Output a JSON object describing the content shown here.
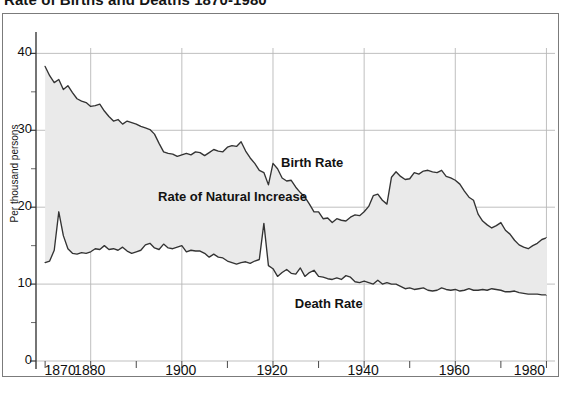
{
  "title": "Rate of Births and Deaths 1870-1980",
  "caption": "",
  "axis": {
    "y_label": "Per thousand persons",
    "y_ticks": [
      0,
      10,
      20,
      30,
      40
    ],
    "y_minor_ticks": [
      5,
      15,
      25,
      35
    ],
    "x_ticks_labeled": [
      1870,
      1880,
      1900,
      1920,
      1940,
      1960,
      1980
    ],
    "x_ticks_unlabeled": [
      1890,
      1910,
      1930,
      1950,
      1970
    ]
  },
  "annotations": [
    {
      "name": "birth-rate",
      "text": "Birth Rate",
      "x": 1922,
      "y": 25.6
    },
    {
      "name": "death-rate",
      "text": "Death Rate",
      "x": 1925,
      "y": 7.3
    },
    {
      "name": "rate-of-natural-increase",
      "text": "Rate of Natural Increase",
      "x": 1895,
      "y": 21.2
    }
  ],
  "colors": {
    "line": "#333333",
    "fill": "#eaeaea",
    "grid": "#b8b8b8",
    "frame": "#7b7b7b",
    "text": "#101010",
    "background": "#ffffff"
  },
  "chart_data": {
    "type": "area",
    "title": "Rate of Births and Deaths 1870-1980",
    "xlabel": "",
    "ylabel": "Per thousand persons",
    "xlim": [
      1868,
      1981
    ],
    "ylim": [
      0,
      42
    ],
    "grid": true,
    "legend": "inline-annotations",
    "fill_between": {
      "upper": "Birth Rate",
      "lower": "Death Rate",
      "label": "Rate of Natural Increase",
      "color": "#eaeaea"
    },
    "x": [
      1870,
      1871,
      1872,
      1873,
      1874,
      1875,
      1876,
      1877,
      1878,
      1879,
      1880,
      1881,
      1882,
      1883,
      1884,
      1885,
      1886,
      1887,
      1888,
      1889,
      1890,
      1891,
      1892,
      1893,
      1894,
      1895,
      1896,
      1897,
      1898,
      1899,
      1900,
      1901,
      1902,
      1903,
      1904,
      1905,
      1906,
      1907,
      1908,
      1909,
      1910,
      1911,
      1912,
      1913,
      1914,
      1915,
      1916,
      1917,
      1918,
      1919,
      1920,
      1921,
      1922,
      1923,
      1924,
      1925,
      1926,
      1927,
      1928,
      1929,
      1930,
      1931,
      1932,
      1933,
      1934,
      1935,
      1936,
      1937,
      1938,
      1939,
      1940,
      1941,
      1942,
      1943,
      1944,
      1945,
      1946,
      1947,
      1948,
      1949,
      1950,
      1951,
      1952,
      1953,
      1954,
      1955,
      1956,
      1957,
      1958,
      1959,
      1960,
      1961,
      1962,
      1963,
      1964,
      1965,
      1966,
      1967,
      1968,
      1969,
      1970,
      1971,
      1972,
      1973,
      1974,
      1975,
      1976,
      1977,
      1978,
      1979,
      1980
    ],
    "series": [
      {
        "name": "Birth Rate",
        "values": [
          38.3,
          37.1,
          36.2,
          36.6,
          35.3,
          35.8,
          34.9,
          34.1,
          33.8,
          33.6,
          33.1,
          33.2,
          33.4,
          32.5,
          31.8,
          31.2,
          31.4,
          30.8,
          31.2,
          31.0,
          30.8,
          30.5,
          30.3,
          30.1,
          29.5,
          28.3,
          27.2,
          27.0,
          26.9,
          26.6,
          26.8,
          27.0,
          26.8,
          27.2,
          27.1,
          26.7,
          27.1,
          27.5,
          27.3,
          27.2,
          27.8,
          28.0,
          27.9,
          28.5,
          27.3,
          26.4,
          25.7,
          24.8,
          24.5,
          22.9,
          25.7,
          25.0,
          23.8,
          23.4,
          23.5,
          22.6,
          21.9,
          21.3,
          20.4,
          19.4,
          19.4,
          18.5,
          18.6,
          18.0,
          18.5,
          18.3,
          18.2,
          18.7,
          19.0,
          18.9,
          19.4,
          20.1,
          21.5,
          21.7,
          20.9,
          20.4,
          23.9,
          24.6,
          24.0,
          23.6,
          23.7,
          24.5,
          24.3,
          24.7,
          24.8,
          24.6,
          24.5,
          24.8,
          24.0,
          23.8,
          23.5,
          23.0,
          22.1,
          21.3,
          20.9,
          19.1,
          18.2,
          17.7,
          17.3,
          17.6,
          18.0,
          17.0,
          16.5,
          15.7,
          15.1,
          14.8,
          14.6,
          15.0,
          15.3,
          15.8,
          16.0
        ]
      },
      {
        "name": "Death Rate",
        "values": [
          12.8,
          13.0,
          14.4,
          19.4,
          16.3,
          14.6,
          14.0,
          13.9,
          14.1,
          14.0,
          14.2,
          14.6,
          14.5,
          15.0,
          14.5,
          14.6,
          14.4,
          14.8,
          14.3,
          14.0,
          14.2,
          14.4,
          15.1,
          15.3,
          14.7,
          14.5,
          15.2,
          14.7,
          14.6,
          14.8,
          15.0,
          14.2,
          14.4,
          14.3,
          14.3,
          14.0,
          13.5,
          13.9,
          13.5,
          13.4,
          13.0,
          12.8,
          12.6,
          12.8,
          12.9,
          12.7,
          13.0,
          13.2,
          17.9,
          12.4,
          12.0,
          11.0,
          11.5,
          11.9,
          11.4,
          11.3,
          12.1,
          11.0,
          11.5,
          11.8,
          11.0,
          10.9,
          10.7,
          10.6,
          10.8,
          10.6,
          11.1,
          10.9,
          10.3,
          10.2,
          10.4,
          10.2,
          10.0,
          10.5,
          10.0,
          10.2,
          10.0,
          10.0,
          9.7,
          9.4,
          9.5,
          9.3,
          9.4,
          9.5,
          9.2,
          9.1,
          9.2,
          9.5,
          9.3,
          9.2,
          9.3,
          9.1,
          9.2,
          9.4,
          9.2,
          9.2,
          9.3,
          9.2,
          9.4,
          9.3,
          9.2,
          9.0,
          9.0,
          9.1,
          8.9,
          8.8,
          8.7,
          8.7,
          8.7,
          8.6,
          8.6
        ]
      }
    ]
  }
}
